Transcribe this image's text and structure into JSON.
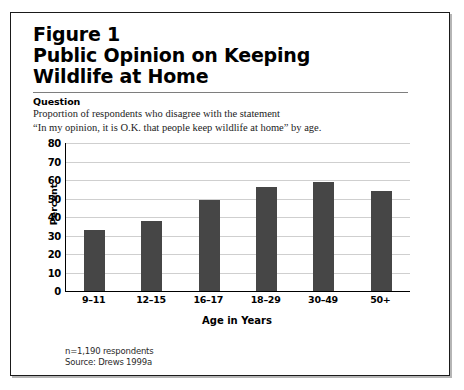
{
  "figure": {
    "title_line_1": "Figure 1",
    "title_line_2": "Public Opinion on Keeping",
    "title_line_3": "Wildlife at Home",
    "question_label": "Question",
    "question_line_1": "Proportion of respondents who disagree with the statement",
    "question_line_2": "“In my opinion, it is O.K. that people keep wildlife at home” by age.",
    "footnote_1": "n=1,190 respondents",
    "footnote_2": "Source: Drews 1999a"
  },
  "chart_data": {
    "type": "bar",
    "title": "Public Opinion on Keeping Wildlife at Home",
    "categories": [
      "9–11",
      "12–15",
      "16–17",
      "18–29",
      "30–49",
      "50+"
    ],
    "values": [
      33,
      38,
      49,
      56,
      59,
      54
    ],
    "xlabel": "Age in Years",
    "ylabel": "Percent",
    "ylim": [
      0,
      80
    ],
    "yticks": [
      80,
      70,
      60,
      50,
      40,
      30,
      20,
      10,
      0
    ],
    "ytick_labels": [
      "80",
      "70",
      "60",
      "50",
      "40",
      "30",
      "20",
      "10",
      "0"
    ],
    "grid": true,
    "legend": false,
    "bar_color": "#464646",
    "gridline_color": "#cfcfcf",
    "axis_color": "#000000"
  }
}
